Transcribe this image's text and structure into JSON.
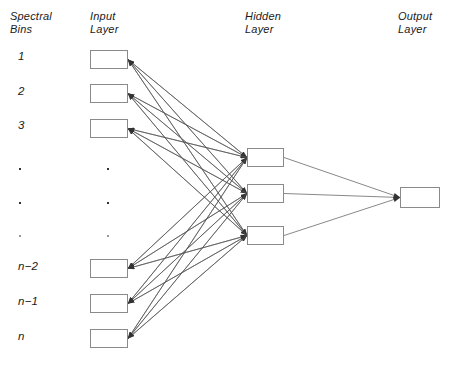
{
  "figure": {
    "type": "neural-network-architecture-diagram",
    "background_color": "#ffffff",
    "box_border_color": "#8a8a8a",
    "edge_color": "#555555",
    "text_color": "#1a1a1a"
  },
  "headers": {
    "spectral_bins": "Spectral\nBins",
    "input_layer": "Input\nLayer",
    "hidden_layer": "Hidden\nLayer",
    "output_layer": "Output\nLayer"
  },
  "header_positions": {
    "spectral_bins": {
      "x": 10,
      "y": 10
    },
    "input_layer": {
      "x": 90,
      "y": 10
    },
    "hidden_layer": {
      "x": 245,
      "y": 10
    },
    "output_layer": {
      "x": 398,
      "y": 10
    }
  },
  "bin_labels": [
    {
      "text": "1",
      "x": 18,
      "y": 50
    },
    {
      "text": "2",
      "x": 18,
      "y": 85
    },
    {
      "text": "3",
      "x": 18,
      "y": 119
    },
    {
      "text": "n−2",
      "x": 18,
      "y": 260
    },
    {
      "text": "n−1",
      "x": 18,
      "y": 295
    },
    {
      "text": "n",
      "x": 18,
      "y": 330
    }
  ],
  "ellipsis_dots": {
    "label_column_x": 19,
    "input_column_x": 107,
    "rows_y": [
      168,
      202,
      235
    ],
    "faint_row_index": 2
  },
  "layers": {
    "input": {
      "name": "Input Layer",
      "box_width": 38,
      "box_height": 19,
      "x": 90,
      "nodes_y": [
        50,
        84,
        119,
        259,
        294,
        329
      ],
      "node_count_visible": 6
    },
    "hidden": {
      "name": "Hidden Layer",
      "box_width": 37,
      "box_height": 19,
      "x": 247,
      "nodes_y": [
        148,
        184,
        226
      ],
      "node_count_visible": 3
    },
    "output": {
      "name": "Output Layer",
      "box_width": 40,
      "box_height": 21,
      "x": 400,
      "nodes_y": [
        187
      ],
      "node_count_visible": 1
    }
  },
  "connections": {
    "input_to_hidden": "fully-connected",
    "hidden_to_output": "fully-connected",
    "arrow_direction": "into-box-left-edge-and-input-right-edge",
    "input_to_hidden_count": 18,
    "hidden_to_output_count": 3
  }
}
